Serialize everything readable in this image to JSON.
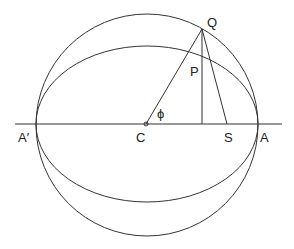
{
  "diagram": {
    "labels": {
      "Q": "Q",
      "P": "P",
      "phi": "ϕ",
      "A_prime": "A′",
      "C": "C",
      "S": "S",
      "A": "A"
    },
    "geometry": {
      "center": [
        147,
        125
      ],
      "circle_radius": 111,
      "ellipse_rx": 111,
      "ellipse_ry": 78,
      "Q": [
        202,
        29
      ],
      "foot_of_perpendicular": [
        202,
        124
      ],
      "S": [
        227,
        124
      ],
      "axis_line": [
        [
          15,
          124
        ],
        [
          282,
          124
        ]
      ]
    },
    "colors": {
      "stroke": "#333333",
      "background": "#ffffff"
    }
  }
}
